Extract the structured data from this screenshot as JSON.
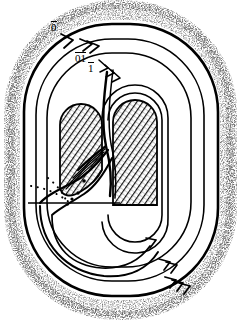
{
  "figure": {
    "kind": "topological-diagram",
    "background_color": "#ffffff",
    "ink_color": "#000000",
    "hatch_color": "#1a1a1a",
    "stipple_color": "#3a3a3a",
    "labels": [
      {
        "id": "label-0",
        "text": "0",
        "overline": true,
        "x": 51,
        "y": 21
      },
      {
        "id": "label-01",
        "text": "01",
        "overline": true,
        "x": 75,
        "y": 52
      },
      {
        "id": "label-1",
        "text": "1",
        "overline": true,
        "x": 88,
        "y": 62
      }
    ],
    "arrow_marks": [
      {
        "id": "arrow-top-outer",
        "chevrons": 1,
        "position": "top-left-outer-strand"
      },
      {
        "id": "arrow-top-second",
        "chevrons": 2,
        "position": "top-left-second-strand"
      },
      {
        "id": "arrow-top-inner",
        "chevrons": 3,
        "position": "top-inner-strand"
      },
      {
        "id": "arrow-bottom-inner",
        "chevrons": 1,
        "position": "bottom-right-inner-strand"
      },
      {
        "id": "arrow-bottom-mid",
        "chevrons": 2,
        "position": "bottom-right-middle-strand"
      },
      {
        "id": "arrow-bottom-outer",
        "chevrons": 3,
        "position": "bottom-right-outer-strand"
      }
    ],
    "regions": [
      {
        "id": "outer-stipple",
        "fill": "stipple",
        "role": "complement-of-stadium"
      },
      {
        "id": "left-lobe",
        "fill": "hatch",
        "role": "inner-hatched-lobe-left"
      },
      {
        "id": "right-lobe",
        "fill": "hatch",
        "role": "inner-hatched-lobe-right"
      }
    ],
    "dotted_curves": 2,
    "chord": {
      "id": "horizontal-chord",
      "x1": 28,
      "y1": 203,
      "x2": 120,
      "y2": 203
    }
  }
}
